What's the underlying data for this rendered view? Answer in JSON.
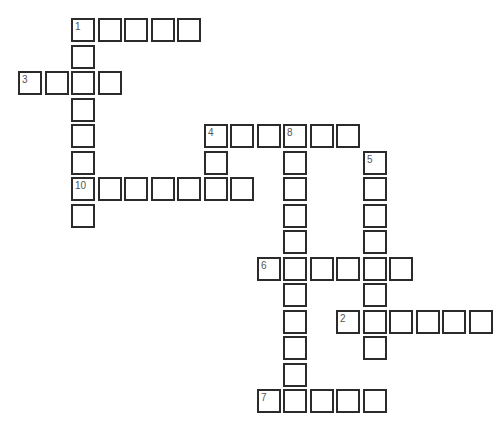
{
  "puzzle": {
    "type": "crossword",
    "cell_pitch": 26.5,
    "origin": {
      "x": 18,
      "y": 18
    },
    "entries": [
      {
        "number": "1",
        "direction": "across",
        "row": 0,
        "col": 2,
        "length": 5
      },
      {
        "number": "1",
        "direction": "down",
        "row": 0,
        "col": 2,
        "length": 8
      },
      {
        "number": "3",
        "direction": "across",
        "row": 2,
        "col": 0,
        "length": 4
      },
      {
        "number": "4",
        "direction": "across",
        "row": 4,
        "col": 7,
        "length": 6
      },
      {
        "number": "4",
        "direction": "down",
        "row": 4,
        "col": 7,
        "length": 3
      },
      {
        "number": "8",
        "direction": "down",
        "row": 4,
        "col": 10,
        "length": 11
      },
      {
        "number": "5",
        "direction": "down",
        "row": 5,
        "col": 13,
        "length": 8
      },
      {
        "number": "10",
        "direction": "across",
        "row": 6,
        "col": 2,
        "length": 7
      },
      {
        "number": "6",
        "direction": "across",
        "row": 9,
        "col": 9,
        "length": 6
      },
      {
        "number": "2",
        "direction": "across",
        "row": 11,
        "col": 12,
        "length": 6
      },
      {
        "number": "7",
        "direction": "across",
        "row": 14,
        "col": 9,
        "length": 5
      }
    ]
  }
}
